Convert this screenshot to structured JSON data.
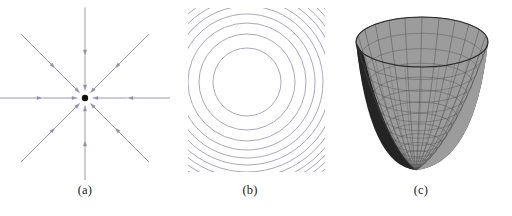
{
  "figure": {
    "background_color": "#ffffff",
    "width": 512,
    "height": 216
  },
  "panels": [
    {
      "id": "a",
      "caption": "(a)",
      "kind": "vector-field",
      "description": "Radial vector field of inward-pointing arrows converging on a central point",
      "center": {
        "x": 85,
        "y": 98
      },
      "center_dot_radius": 3.2,
      "center_dot_color": "#111111",
      "arrow_color": "#8f8fa8",
      "arrow_stroke_width": 0.9,
      "directions_deg": [
        0,
        45,
        90,
        135,
        180,
        225,
        270,
        315
      ],
      "rings": [
        {
          "name": "inner",
          "start_radius": 42,
          "end_radius": 13
        },
        {
          "name": "outer",
          "start_radius": 90,
          "end_radius": 48
        }
      ],
      "arrow_head_length": 5.5,
      "arrow_head_width": 3.2
    },
    {
      "id": "b",
      "caption": "(b)",
      "kind": "contour-plot",
      "description": "Concentric circular level curves of z = x^2 + y^2, clipped to a square window",
      "center": {
        "x": 77,
        "y": 82
      },
      "clip_rect": {
        "x": 18,
        "y": 8,
        "width": 137,
        "height": 164
      },
      "contour_color": "#9a9ab0",
      "contour_stroke_width": 0.85,
      "level_count": 18,
      "level_values": [
        1,
        4,
        9,
        16,
        25,
        36,
        49,
        64,
        81,
        100,
        121,
        144,
        169,
        196,
        225,
        256,
        289,
        324
      ],
      "radii": [
        34,
        48,
        59,
        68,
        76,
        83,
        90,
        96,
        102,
        107,
        112,
        117,
        122,
        126,
        131,
        135,
        139,
        143
      ],
      "radius_formula": "r = k * sqrt(level)"
    },
    {
      "id": "c",
      "caption": "(c)",
      "kind": "surface-3d",
      "description": "Wireframe-shaded paraboloid surface z = x^2 + y^2 viewed from above the rim",
      "surface_fill_inner": "#9c9c9c",
      "surface_fill_outer": "#3a3a3a",
      "surface_fill_dark_edge": "#1a1a1a",
      "mesh_color": "#4a4a4a",
      "mesh_stroke_width": 0.55,
      "rim": {
        "cx": 92,
        "cy": 42,
        "rx": 66,
        "ry": 25
      },
      "apex": {
        "x": 86,
        "y": 170
      },
      "u_divisions": 24,
      "v_divisions": 14
    }
  ],
  "colors": {
    "background": "#ffffff",
    "ink": "#1a1a1a",
    "arrow": "#8f8fa8",
    "contour": "#9a9ab0",
    "surface_light": "#9c9c9c",
    "surface_dark": "#3a3a3a",
    "mesh": "#4a4a4a"
  }
}
